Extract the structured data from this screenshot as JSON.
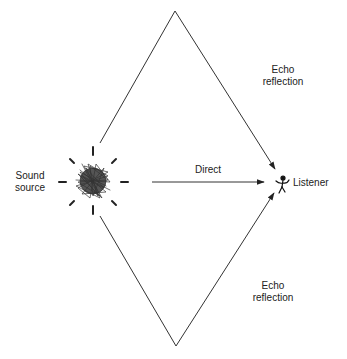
{
  "diagram": {
    "type": "sound-propagation",
    "nodes": {
      "source": {
        "label_line1": "Sound",
        "label_line2": "source"
      },
      "listener": {
        "label": "Listener"
      }
    },
    "paths": {
      "direct": {
        "label": "Direct"
      },
      "echo_top": {
        "label_line1": "Echo",
        "label_line2": "reflection"
      },
      "echo_bottom": {
        "label_line1": "Echo",
        "label_line2": "reflection"
      }
    },
    "colors": {
      "line": "#333333",
      "text": "#222222",
      "background": "#ffffff"
    }
  }
}
